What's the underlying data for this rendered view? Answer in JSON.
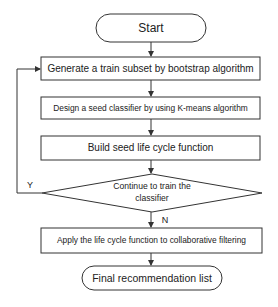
{
  "diagram": {
    "type": "flowchart",
    "nodes": {
      "start": {
        "label": "Start",
        "shape": "terminal"
      },
      "step1": {
        "label": "Generate a train subset by bootstrap algorithm",
        "shape": "process"
      },
      "step2": {
        "label": "Design a seed classifier by using K-means algorithm",
        "shape": "process"
      },
      "step3": {
        "label": "Build seed life cycle function",
        "shape": "process"
      },
      "decision": {
        "label": "Continue to train the classifier",
        "line1": "Continue to train the",
        "line2": "classifier",
        "shape": "decision"
      },
      "step4": {
        "label": "Apply the life cycle function to collaborative filtering",
        "shape": "process"
      },
      "end": {
        "label": "Final recommendation list",
        "shape": "terminal"
      }
    },
    "edges": [
      {
        "from": "start",
        "to": "step1",
        "label": ""
      },
      {
        "from": "step1",
        "to": "step2",
        "label": ""
      },
      {
        "from": "step2",
        "to": "step3",
        "label": ""
      },
      {
        "from": "step3",
        "to": "decision",
        "label": ""
      },
      {
        "from": "decision",
        "to": "step1",
        "label": "Y"
      },
      {
        "from": "decision",
        "to": "step4",
        "label": "N"
      },
      {
        "from": "step4",
        "to": "end",
        "label": ""
      }
    ],
    "edge_labels": {
      "yes": "Y",
      "no": "N"
    },
    "colors": {
      "stroke": "#333333",
      "text": "#222222",
      "background": "#ffffff"
    }
  }
}
